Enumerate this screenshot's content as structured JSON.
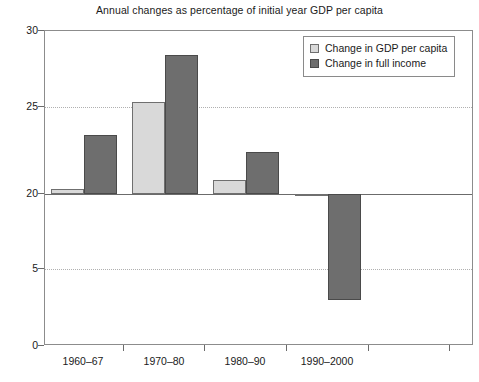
{
  "chart_data": {
    "type": "bar",
    "title": "Annual changes as percentage of initial year GDP per capita",
    "xlabel": "",
    "ylabel": "",
    "categories": [
      "1960–67",
      "1970–80",
      "1980–90",
      "1990–2000"
    ],
    "series": [
      {
        "name": "Change in GDP per capita",
        "color": "#d9d9d9",
        "values": [
          20.3,
          25.3,
          20.8,
          19.6
        ]
      },
      {
        "name": "Change in full income",
        "color": "#6e6e6e",
        "values": [
          23.4,
          28.4,
          22.4,
          3.0
        ]
      }
    ],
    "ytick_labels": [
      "30",
      "25",
      "20",
      "5",
      "0"
    ],
    "ytick_values": [
      30,
      25,
      20,
      5,
      0
    ],
    "ylim": [
      0,
      30
    ],
    "baseline_value": 20,
    "grid": true,
    "grid_axis": "y",
    "legend_position": "top-right",
    "legend_entries": [
      "Change in GDP per capita",
      "Change in full income"
    ]
  },
  "axis_geometry": {
    "ytick_pixels": [
      30,
      106,
      193,
      268,
      345
    ],
    "xtick_pixels": [
      123,
      204,
      286,
      368,
      449
    ],
    "group_centers_px": [
      83,
      164,
      245,
      327
    ],
    "plot_left_px": 44,
    "plot_top_px": 30,
    "plot_width_px": 429,
    "plot_height_px": 315
  }
}
